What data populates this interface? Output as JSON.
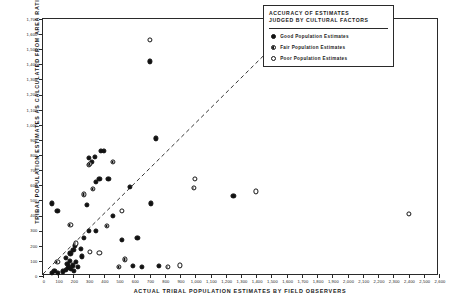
{
  "axes": {
    "x_title": "ACTUAL TRIBAL POPULATION ESTIMATES BY FIELD OBSERVERS",
    "y_title": "TRIBAL POPULATION ESTIMATES AS CALCULATED FROM AREA RATIOS"
  },
  "legend": {
    "title": "ACCURACY OF ESTIMATES\nJUDGED BY CULTURAL FACTORS",
    "items": [
      {
        "key": "good",
        "label": "Good Population Estimates",
        "marker": "filled-circle"
      },
      {
        "key": "fair",
        "label": "Fair Population Estimates",
        "marker": "half-filled-circle"
      },
      {
        "key": "poor",
        "label": "Poor Population Estimates",
        "marker": "open-circle"
      }
    ]
  },
  "chart_data": {
    "type": "scatter",
    "title": "",
    "xlabel": "ACTUAL TRIBAL POPULATION ESTIMATES BY FIELD OBSERVERS",
    "ylabel": "TRIBAL POPULATION ESTIMATES AS CALCULATED FROM AREA RATIOS",
    "xlim": [
      0,
      2600
    ],
    "ylim": [
      0,
      1700
    ],
    "xticks": [
      0,
      100,
      200,
      300,
      400,
      500,
      600,
      700,
      800,
      900,
      1000,
      1100,
      1200,
      1300,
      1400,
      1500,
      1600,
      1700,
      1800,
      1900,
      2000,
      2100,
      2200,
      2300,
      2400,
      2500,
      2600
    ],
    "xtick_labels": [
      "0",
      "100",
      "200",
      "300",
      "400",
      "500",
      "600",
      "700",
      "800",
      "900",
      "1,000",
      "1,100",
      "1,200",
      "1,300",
      "1,400",
      "1,500",
      "1,600",
      "1,700",
      "1,800",
      "1,900",
      "2,000",
      "2,100",
      "2,200",
      "2,300",
      "2,400",
      "2,500",
      "2,600"
    ],
    "yticks": [
      0,
      100,
      200,
      300,
      400,
      500,
      600,
      700,
      800,
      900,
      1000,
      1100,
      1200,
      1300,
      1400,
      1500,
      1600,
      1700
    ],
    "ytick_labels": [
      "0",
      "100",
      "200",
      "300",
      "400",
      "500",
      "600",
      "700",
      "800",
      "900",
      "1,000",
      "1,100",
      "1,200",
      "1,300",
      "1,400",
      "1,500",
      "1,600",
      "1,700"
    ],
    "grid": false,
    "legend_position": "top-right",
    "reference_line": {
      "label": "1:1 identity line (dashed)",
      "style": "dashed",
      "x": [
        0,
        1700
      ],
      "y": [
        0,
        1700
      ]
    },
    "series": [
      {
        "name": "Good Population Estimates",
        "marker": "filled-circle",
        "points": [
          [
            60,
            20
          ],
          [
            75,
            35
          ],
          [
            100,
            20
          ],
          [
            130,
            30
          ],
          [
            150,
            40
          ],
          [
            150,
            120
          ],
          [
            160,
            80
          ],
          [
            165,
            55
          ],
          [
            170,
            60
          ],
          [
            175,
            100
          ],
          [
            180,
            150
          ],
          [
            185,
            45
          ],
          [
            195,
            70
          ],
          [
            200,
            170
          ],
          [
            205,
            35
          ],
          [
            210,
            200
          ],
          [
            215,
            95
          ],
          [
            230,
            60
          ],
          [
            250,
            180
          ],
          [
            255,
            130
          ],
          [
            270,
            250
          ],
          [
            290,
            470
          ],
          [
            300,
            300
          ],
          [
            300,
            780
          ],
          [
            320,
            755
          ],
          [
            340,
            790
          ],
          [
            345,
            300
          ],
          [
            350,
            620
          ],
          [
            370,
            640
          ],
          [
            380,
            825
          ],
          [
            400,
            825
          ],
          [
            430,
            640
          ],
          [
            460,
            400
          ],
          [
            520,
            240
          ],
          [
            570,
            590
          ],
          [
            590,
            65
          ],
          [
            620,
            250
          ],
          [
            650,
            60
          ],
          [
            700,
            1420
          ],
          [
            710,
            480
          ],
          [
            740,
            910
          ],
          [
            760,
            65
          ],
          [
            1250,
            530
          ],
          [
            60,
            480
          ],
          [
            95,
            430
          ]
        ]
      },
      {
        "name": "Fair Population Estimates",
        "marker": "half-filled-circle",
        "points": [
          [
            95,
            95
          ],
          [
            180,
            340
          ],
          [
            215,
            215
          ],
          [
            270,
            540
          ],
          [
            300,
            735
          ],
          [
            310,
            740
          ],
          [
            330,
            575
          ],
          [
            420,
            330
          ],
          [
            460,
            755
          ],
          [
            500,
            60
          ],
          [
            540,
            110
          ],
          [
            820,
            60
          ],
          [
            990,
            585
          ]
        ]
      },
      {
        "name": "Poor Population Estimates",
        "marker": "open-circle",
        "points": [
          [
            310,
            160
          ],
          [
            370,
            155
          ],
          [
            520,
            430
          ],
          [
            700,
            1560
          ],
          [
            900,
            70
          ],
          [
            1000,
            640
          ],
          [
            1400,
            560
          ],
          [
            2400,
            410
          ]
        ]
      }
    ]
  }
}
